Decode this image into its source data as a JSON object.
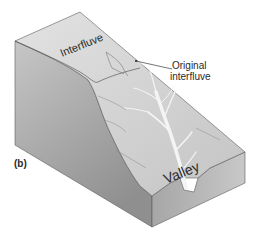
{
  "figure": {
    "panel_label": "(b)",
    "labels": {
      "interfluve": "Interfluve",
      "original_interfluve_line1": "Original",
      "original_interfluve_line2": "interfluve",
      "valley": "Valley"
    },
    "colors": {
      "background": "#ffffff",
      "top_surface": "#d3d3d3",
      "left_face": "#a9a9a9",
      "front_face": "#b4b4b4",
      "right_face": "#c4c4c4",
      "edge_line": "#5a5a5a",
      "valley_stream": "#f4f4f4",
      "text": "#2a2a2a"
    }
  }
}
